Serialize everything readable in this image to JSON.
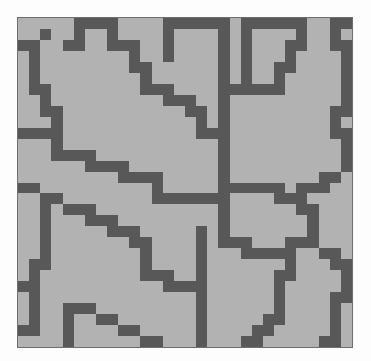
{
  "figure": {
    "name": "pixel-grid-maze"
  },
  "chart_data": {
    "type": "heatmap",
    "title": "",
    "subtitle": "",
    "xlabel": "",
    "ylabel": "",
    "legend": [],
    "grid": false,
    "rows": 30,
    "cols": 30,
    "cell_px": 11,
    "value_labels": {
      "0": "open cell (light gray)",
      "1": "wall cell (dark gray)"
    },
    "colors": {
      "background": "#fdfdfd",
      "open": "#b2b2b2",
      "wall": "#585858",
      "border": "#6e6e6e"
    },
    "matrix": [
      [
        0,
        0,
        0,
        0,
        0,
        1,
        1,
        1,
        1,
        0,
        0,
        0,
        0,
        1,
        1,
        1,
        1,
        1,
        1,
        0,
        1,
        1,
        1,
        1,
        1,
        1,
        0,
        0,
        1,
        1
      ],
      [
        0,
        0,
        1,
        0,
        0,
        1,
        0,
        0,
        1,
        0,
        0,
        0,
        0,
        1,
        0,
        0,
        0,
        0,
        1,
        0,
        1,
        0,
        0,
        0,
        0,
        1,
        0,
        0,
        1,
        0
      ],
      [
        1,
        1,
        0,
        0,
        1,
        1,
        0,
        0,
        1,
        1,
        1,
        0,
        0,
        1,
        0,
        0,
        0,
        0,
        1,
        0,
        1,
        0,
        0,
        0,
        1,
        1,
        0,
        0,
        1,
        1
      ],
      [
        0,
        1,
        0,
        0,
        0,
        0,
        0,
        0,
        0,
        0,
        1,
        0,
        0,
        1,
        0,
        0,
        0,
        0,
        1,
        0,
        1,
        0,
        0,
        0,
        1,
        0,
        0,
        0,
        0,
        1
      ],
      [
        0,
        1,
        0,
        0,
        0,
        0,
        0,
        0,
        0,
        0,
        1,
        1,
        0,
        0,
        0,
        0,
        0,
        0,
        1,
        0,
        1,
        0,
        0,
        1,
        1,
        0,
        0,
        0,
        0,
        1
      ],
      [
        0,
        1,
        0,
        0,
        0,
        0,
        0,
        0,
        0,
        0,
        0,
        1,
        0,
        0,
        0,
        0,
        0,
        0,
        1,
        0,
        1,
        0,
        0,
        1,
        0,
        0,
        0,
        0,
        0,
        1
      ],
      [
        0,
        1,
        1,
        0,
        0,
        0,
        0,
        0,
        0,
        0,
        0,
        1,
        1,
        1,
        0,
        0,
        0,
        0,
        1,
        1,
        1,
        1,
        1,
        1,
        0,
        0,
        0,
        0,
        0,
        1
      ],
      [
        0,
        0,
        1,
        0,
        0,
        0,
        0,
        0,
        0,
        0,
        0,
        0,
        0,
        1,
        1,
        1,
        0,
        0,
        1,
        0,
        0,
        0,
        0,
        0,
        0,
        0,
        0,
        0,
        0,
        1
      ],
      [
        0,
        0,
        1,
        1,
        0,
        0,
        0,
        0,
        0,
        0,
        0,
        0,
        0,
        0,
        0,
        1,
        1,
        0,
        1,
        0,
        0,
        0,
        0,
        0,
        0,
        0,
        0,
        0,
        1,
        1
      ],
      [
        0,
        0,
        0,
        1,
        0,
        0,
        0,
        0,
        0,
        0,
        0,
        0,
        0,
        0,
        0,
        0,
        1,
        0,
        1,
        0,
        0,
        0,
        0,
        0,
        0,
        0,
        0,
        0,
        1,
        0
      ],
      [
        1,
        1,
        1,
        1,
        0,
        0,
        0,
        0,
        0,
        0,
        0,
        0,
        0,
        0,
        0,
        0,
        1,
        1,
        1,
        0,
        0,
        0,
        0,
        0,
        0,
        0,
        0,
        0,
        1,
        1
      ],
      [
        0,
        0,
        0,
        1,
        0,
        0,
        0,
        0,
        0,
        0,
        0,
        0,
        0,
        0,
        0,
        0,
        0,
        0,
        1,
        0,
        0,
        0,
        0,
        0,
        0,
        0,
        0,
        0,
        0,
        1
      ],
      [
        0,
        0,
        0,
        1,
        1,
        1,
        1,
        0,
        0,
        0,
        0,
        0,
        0,
        0,
        0,
        0,
        0,
        0,
        1,
        0,
        0,
        0,
        0,
        0,
        0,
        0,
        0,
        0,
        0,
        1
      ],
      [
        0,
        0,
        0,
        0,
        0,
        0,
        1,
        1,
        1,
        1,
        0,
        0,
        0,
        0,
        0,
        0,
        0,
        0,
        1,
        0,
        0,
        0,
        0,
        0,
        0,
        0,
        0,
        0,
        0,
        1
      ],
      [
        0,
        0,
        0,
        0,
        0,
        0,
        0,
        0,
        0,
        1,
        1,
        1,
        1,
        0,
        0,
        0,
        0,
        0,
        1,
        0,
        0,
        0,
        0,
        0,
        0,
        0,
        0,
        1,
        1,
        0
      ],
      [
        1,
        1,
        0,
        0,
        0,
        0,
        0,
        0,
        0,
        0,
        0,
        0,
        1,
        0,
        0,
        0,
        0,
        0,
        1,
        1,
        1,
        1,
        1,
        1,
        0,
        1,
        1,
        1,
        0,
        0
      ],
      [
        0,
        0,
        1,
        1,
        0,
        0,
        0,
        0,
        0,
        0,
        0,
        0,
        1,
        1,
        1,
        1,
        1,
        1,
        1,
        0,
        0,
        0,
        0,
        1,
        1,
        1,
        0,
        0,
        0,
        0
      ],
      [
        0,
        0,
        1,
        0,
        1,
        1,
        1,
        0,
        0,
        0,
        0,
        0,
        0,
        0,
        0,
        0,
        0,
        0,
        1,
        0,
        0,
        0,
        0,
        0,
        0,
        1,
        1,
        0,
        0,
        0
      ],
      [
        0,
        0,
        1,
        0,
        0,
        0,
        1,
        1,
        1,
        0,
        0,
        0,
        0,
        0,
        0,
        0,
        0,
        0,
        1,
        0,
        0,
        0,
        0,
        0,
        0,
        0,
        1,
        0,
        0,
        0
      ],
      [
        0,
        0,
        1,
        0,
        0,
        0,
        0,
        0,
        1,
        1,
        1,
        0,
        0,
        0,
        0,
        0,
        1,
        0,
        1,
        0,
        0,
        0,
        0,
        0,
        0,
        0,
        1,
        0,
        0,
        0
      ],
      [
        0,
        0,
        1,
        0,
        0,
        0,
        0,
        0,
        0,
        0,
        1,
        1,
        0,
        0,
        0,
        0,
        1,
        0,
        1,
        1,
        1,
        0,
        0,
        0,
        1,
        1,
        1,
        0,
        0,
        0
      ],
      [
        0,
        0,
        1,
        0,
        0,
        0,
        0,
        0,
        0,
        0,
        0,
        1,
        0,
        0,
        0,
        0,
        1,
        0,
        0,
        0,
        1,
        1,
        1,
        1,
        1,
        0,
        0,
        1,
        1,
        0
      ],
      [
        0,
        1,
        1,
        0,
        0,
        0,
        0,
        0,
        0,
        0,
        0,
        1,
        0,
        0,
        0,
        0,
        1,
        0,
        0,
        0,
        0,
        0,
        0,
        0,
        1,
        0,
        0,
        0,
        1,
        1
      ],
      [
        0,
        1,
        0,
        0,
        0,
        0,
        0,
        0,
        0,
        0,
        0,
        1,
        1,
        1,
        0,
        0,
        1,
        0,
        0,
        0,
        0,
        0,
        0,
        1,
        1,
        0,
        0,
        0,
        0,
        1
      ],
      [
        1,
        1,
        0,
        0,
        0,
        0,
        0,
        0,
        0,
        0,
        0,
        0,
        0,
        1,
        1,
        1,
        1,
        0,
        0,
        0,
        0,
        0,
        0,
        1,
        0,
        0,
        0,
        0,
        0,
        1
      ],
      [
        0,
        1,
        0,
        0,
        0,
        0,
        0,
        0,
        0,
        0,
        0,
        0,
        0,
        0,
        0,
        0,
        1,
        0,
        0,
        0,
        0,
        0,
        0,
        1,
        0,
        0,
        0,
        0,
        1,
        1
      ],
      [
        0,
        1,
        0,
        0,
        1,
        1,
        1,
        0,
        0,
        0,
        0,
        0,
        0,
        0,
        0,
        0,
        1,
        0,
        0,
        0,
        0,
        0,
        0,
        1,
        0,
        0,
        0,
        0,
        1,
        0
      ],
      [
        0,
        1,
        0,
        0,
        1,
        0,
        0,
        1,
        1,
        0,
        0,
        0,
        0,
        0,
        0,
        0,
        1,
        0,
        0,
        0,
        0,
        0,
        1,
        1,
        0,
        0,
        0,
        0,
        1,
        0
      ],
      [
        1,
        1,
        0,
        0,
        1,
        0,
        0,
        0,
        0,
        1,
        1,
        0,
        0,
        0,
        0,
        0,
        1,
        0,
        0,
        0,
        0,
        1,
        1,
        0,
        0,
        0,
        0,
        0,
        1,
        0
      ],
      [
        0,
        0,
        0,
        0,
        1,
        0,
        0,
        0,
        0,
        0,
        0,
        1,
        1,
        0,
        0,
        0,
        1,
        0,
        0,
        0,
        1,
        1,
        0,
        0,
        0,
        0,
        0,
        1,
        1,
        0
      ]
    ]
  }
}
